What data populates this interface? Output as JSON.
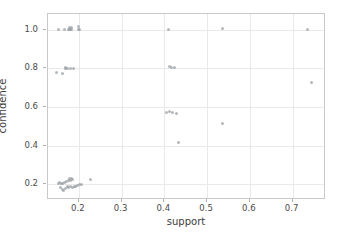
{
  "chart_data": {
    "type": "scatter",
    "title": "",
    "xlabel": "support",
    "ylabel": "confidence",
    "xlim": [
      0.128,
      0.778
    ],
    "ylim": [
      0.118,
      1.082
    ],
    "xticks": [
      0.2,
      0.3,
      0.4,
      0.5,
      0.6,
      0.7
    ],
    "xticklabels": [
      "0.2",
      "0.3",
      "0.4",
      "0.5",
      "0.6",
      "0.7"
    ],
    "yticks": [
      0.2,
      0.4,
      0.6,
      0.8,
      1.0
    ],
    "yticklabels": [
      "0.2",
      "0.4",
      "0.6",
      "0.8",
      "1.0"
    ],
    "grid": true,
    "legend": null,
    "marker": {
      "color": "#9aa0a6",
      "size": 3,
      "opacity": 0.75
    },
    "points": [
      {
        "x": 0.152,
        "y": 1.0
      },
      {
        "x": 0.166,
        "y": 1.0
      },
      {
        "x": 0.175,
        "y": 1.0
      },
      {
        "x": 0.179,
        "y": 1.0
      },
      {
        "x": 0.181,
        "y": 1.0
      },
      {
        "x": 0.183,
        "y": 1.0
      },
      {
        "x": 0.178,
        "y": 1.012
      },
      {
        "x": 0.184,
        "y": 1.014
      },
      {
        "x": 0.199,
        "y": 1.0
      },
      {
        "x": 0.202,
        "y": 1.0
      },
      {
        "x": 0.2,
        "y": 1.015
      },
      {
        "x": 0.41,
        "y": 1.0
      },
      {
        "x": 0.535,
        "y": 1.005
      },
      {
        "x": 0.735,
        "y": 1.002
      },
      {
        "x": 0.149,
        "y": 0.781
      },
      {
        "x": 0.163,
        "y": 0.776
      },
      {
        "x": 0.168,
        "y": 0.8
      },
      {
        "x": 0.17,
        "y": 0.806
      },
      {
        "x": 0.173,
        "y": 0.8
      },
      {
        "x": 0.181,
        "y": 0.797
      },
      {
        "x": 0.188,
        "y": 0.797
      },
      {
        "x": 0.412,
        "y": 0.808
      },
      {
        "x": 0.416,
        "y": 0.806
      },
      {
        "x": 0.424,
        "y": 0.803
      },
      {
        "x": 0.745,
        "y": 0.729
      },
      {
        "x": 0.406,
        "y": 0.572
      },
      {
        "x": 0.412,
        "y": 0.576
      },
      {
        "x": 0.418,
        "y": 0.574
      },
      {
        "x": 0.429,
        "y": 0.568
      },
      {
        "x": 0.535,
        "y": 0.513
      },
      {
        "x": 0.432,
        "y": 0.414
      },
      {
        "x": 0.152,
        "y": 0.205
      },
      {
        "x": 0.156,
        "y": 0.207
      },
      {
        "x": 0.159,
        "y": 0.203
      },
      {
        "x": 0.163,
        "y": 0.206
      },
      {
        "x": 0.167,
        "y": 0.209
      },
      {
        "x": 0.171,
        "y": 0.212
      },
      {
        "x": 0.176,
        "y": 0.221
      },
      {
        "x": 0.179,
        "y": 0.228
      },
      {
        "x": 0.181,
        "y": 0.219
      },
      {
        "x": 0.184,
        "y": 0.232
      },
      {
        "x": 0.186,
        "y": 0.226
      },
      {
        "x": 0.158,
        "y": 0.183
      },
      {
        "x": 0.162,
        "y": 0.175
      },
      {
        "x": 0.165,
        "y": 0.168
      },
      {
        "x": 0.169,
        "y": 0.18
      },
      {
        "x": 0.173,
        "y": 0.186
      },
      {
        "x": 0.177,
        "y": 0.184
      },
      {
        "x": 0.181,
        "y": 0.188
      },
      {
        "x": 0.185,
        "y": 0.182
      },
      {
        "x": 0.189,
        "y": 0.186
      },
      {
        "x": 0.193,
        "y": 0.19
      },
      {
        "x": 0.197,
        "y": 0.193
      },
      {
        "x": 0.201,
        "y": 0.197
      },
      {
        "x": 0.206,
        "y": 0.198
      },
      {
        "x": 0.227,
        "y": 0.224
      }
    ]
  }
}
